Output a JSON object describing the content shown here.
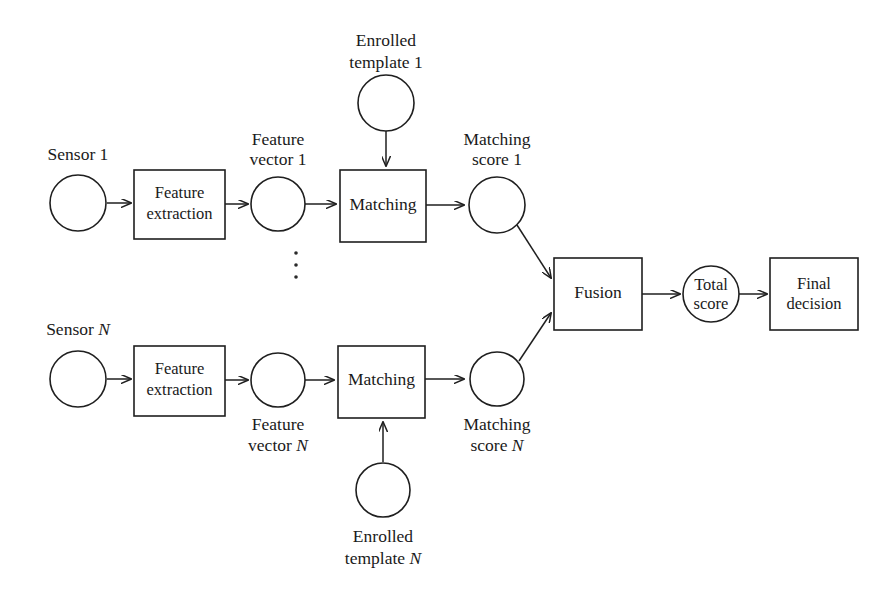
{
  "figure": {
    "background_color": "#ffffff",
    "line_color": "#1f1f1f",
    "text_color": "#1a1a1a"
  },
  "nodes": {
    "sensor_1": {
      "label": "Sensor 1",
      "shape": "circle"
    },
    "feature_extraction_1": {
      "line1": "Feature",
      "line2": "extraction",
      "shape": "rect"
    },
    "feature_vector_1": {
      "line1": "Feature",
      "line2": "vector 1",
      "shape": "circle"
    },
    "enrolled_template_1": {
      "line1": "Enrolled",
      "line2": "template 1",
      "shape": "circle"
    },
    "matching_1": {
      "label": "Matching",
      "shape": "rect"
    },
    "matching_score_1": {
      "line1": "Matching",
      "line2": "score 1",
      "shape": "circle"
    },
    "sensor_n": {
      "label": "Sensor N",
      "shape": "circle"
    },
    "feature_extraction_n": {
      "line1": "Feature",
      "line2": "extraction",
      "shape": "rect"
    },
    "feature_vector_n": {
      "line1": "Feature",
      "line2": "vector N",
      "shape": "circle"
    },
    "enrolled_template_n": {
      "line1": "Enrolled",
      "line2": "template N",
      "shape": "circle"
    },
    "matching_n": {
      "label": "Matching",
      "shape": "rect"
    },
    "matching_score_n": {
      "line1": "Matching",
      "line2": "score N",
      "shape": "circle"
    },
    "fusion": {
      "label": "Fusion",
      "shape": "rect"
    },
    "total_score": {
      "line1": "Total",
      "line2": "score",
      "shape": "circle"
    },
    "final_decision": {
      "line1": "Final",
      "line2": "decision",
      "shape": "rect"
    },
    "ellipsis": {
      "label": "vertical-ellipsis",
      "dots": 3
    }
  },
  "edges": [
    {
      "from": "sensor_1",
      "to": "feature_extraction_1",
      "style": "arrow"
    },
    {
      "from": "feature_extraction_1",
      "to": "feature_vector_1",
      "style": "arrow"
    },
    {
      "from": "feature_vector_1",
      "to": "matching_1",
      "style": "arrow"
    },
    {
      "from": "enrolled_template_1",
      "to": "matching_1",
      "style": "arrow"
    },
    {
      "from": "matching_1",
      "to": "matching_score_1",
      "style": "arrow"
    },
    {
      "from": "matching_score_1",
      "to": "fusion",
      "style": "arrow"
    },
    {
      "from": "sensor_n",
      "to": "feature_extraction_n",
      "style": "arrow"
    },
    {
      "from": "feature_extraction_n",
      "to": "feature_vector_n",
      "style": "arrow"
    },
    {
      "from": "feature_vector_n",
      "to": "matching_n",
      "style": "arrow"
    },
    {
      "from": "enrolled_template_n",
      "to": "matching_n",
      "style": "arrow"
    },
    {
      "from": "matching_n",
      "to": "matching_score_n",
      "style": "arrow"
    },
    {
      "from": "matching_score_n",
      "to": "fusion",
      "style": "arrow"
    },
    {
      "from": "fusion",
      "to": "total_score",
      "style": "arrow"
    },
    {
      "from": "total_score",
      "to": "final_decision",
      "style": "arrow"
    }
  ]
}
